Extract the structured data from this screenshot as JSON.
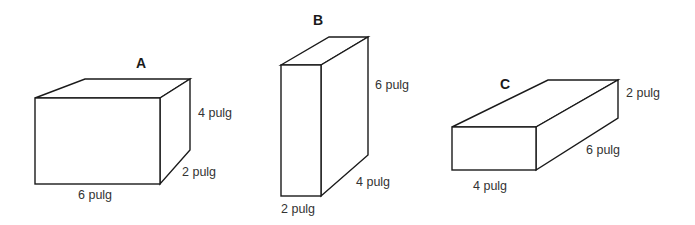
{
  "diagram": {
    "type": "rectangular-prisms",
    "line_color": "#1a1a1a",
    "text_color": "#333333",
    "boxes": [
      {
        "name": "A",
        "dimensions": {
          "length": "6 pulg",
          "depth": "2 pulg",
          "height": "4 pulg"
        },
        "labels": {
          "title": "A",
          "height": "4 pulg",
          "depth": "2 pulg",
          "width": "6 pulg"
        }
      },
      {
        "name": "B",
        "dimensions": {
          "width": "2 pulg",
          "depth": "4 pulg",
          "height": "6 pulg"
        },
        "labels": {
          "title": "B",
          "height": "6 pulg",
          "depth": "4 pulg",
          "width": "2 pulg"
        }
      },
      {
        "name": "C",
        "dimensions": {
          "width": "4 pulg",
          "depth": "6 pulg",
          "height": "2 pulg"
        },
        "labels": {
          "title": "C",
          "height": "2 pulg",
          "depth": "6 pulg",
          "width": "4 pulg"
        }
      }
    ]
  }
}
